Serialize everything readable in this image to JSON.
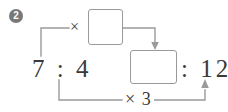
{
  "problem": {
    "number_badge": "2",
    "kind": "ratio-equivalence-diagram"
  },
  "expression": {
    "left_ratio": "7 : 4",
    "right_ratio": ": 12",
    "left_ratio_antecedent": "7",
    "left_ratio_consequent": "4",
    "right_ratio_consequent": "12"
  },
  "operators": {
    "top_multiply": "×",
    "bottom_multiply": "× 3",
    "bottom_multiply_symbol": "×",
    "bottom_multiply_factor": "3"
  },
  "answer_boxes": [
    {
      "id": "top",
      "value": "",
      "placeholder": ""
    },
    {
      "id": "bottom",
      "value": "",
      "placeholder": ""
    }
  ],
  "colors": {
    "ink": "#3a3a3a",
    "line": "#9a9a9a",
    "box_border": "#9a9a9a",
    "badge_bg": "#787878",
    "badge_text": "#ffffff",
    "page_bg": "#ffffff"
  }
}
